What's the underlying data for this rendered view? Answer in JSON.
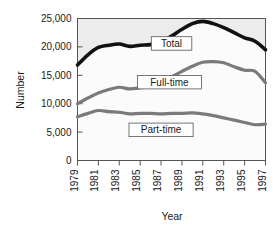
{
  "chart_data": {
    "type": "line",
    "title": "",
    "xlabel": "Year",
    "ylabel": "Number",
    "xlim": [
      1979,
      1997
    ],
    "ylim": [
      0,
      25000
    ],
    "grid": false,
    "legend_position": "inline-labels",
    "x": [
      1979,
      1980,
      1981,
      1982,
      1983,
      1984,
      1985,
      1986,
      1987,
      1988,
      1989,
      1990,
      1991,
      1992,
      1993,
      1994,
      1995,
      1996,
      1997
    ],
    "xtick_labels": [
      "1979",
      "1981",
      "1983",
      "1985",
      "1987",
      "1989",
      "1991",
      "1993",
      "1995",
      "1997"
    ],
    "xticks": [
      1979,
      1981,
      1983,
      1985,
      1987,
      1989,
      1991,
      1993,
      1995,
      1997
    ],
    "ytick_labels": [
      "0",
      "5,000",
      "10,000",
      "15,000",
      "20,000",
      "25,000"
    ],
    "yticks": [
      0,
      5000,
      10000,
      15000,
      20000,
      25000
    ],
    "series": [
      {
        "name": "Total",
        "color": "#111111",
        "width": 3.6,
        "label_x": 1988.0,
        "label_y": 20600,
        "values": [
          16800,
          18600,
          19900,
          20300,
          20500,
          20100,
          20300,
          20400,
          20900,
          21900,
          23100,
          24100,
          24500,
          24100,
          23400,
          22500,
          21600,
          21000,
          19500
        ]
      },
      {
        "name": "Full-time",
        "color": "#7a7a7a",
        "width": 3.2,
        "label_x": 1987.8,
        "label_y": 13800,
        "values": [
          10000,
          11000,
          11900,
          12500,
          12900,
          12600,
          12800,
          13100,
          13600,
          14700,
          15700,
          16600,
          17300,
          17400,
          17200,
          16500,
          15900,
          15700,
          13700
        ]
      },
      {
        "name": "Part-time",
        "color": "#7a7a7a",
        "width": 3.2,
        "label_x": 1987.0,
        "label_y": 5400,
        "values": [
          7700,
          8300,
          8800,
          8600,
          8500,
          8200,
          8300,
          8300,
          8200,
          8300,
          8300,
          8400,
          8200,
          7900,
          7500,
          7100,
          6700,
          6300,
          6400
        ]
      }
    ]
  },
  "axis": {
    "y_title": "Number",
    "x_title": "Year"
  }
}
